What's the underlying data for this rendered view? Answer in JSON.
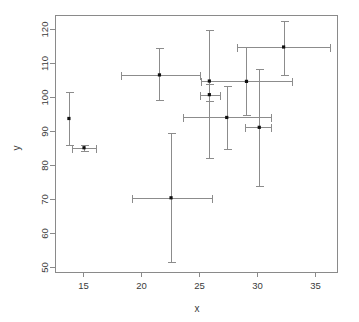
{
  "chart_data": {
    "type": "scatter",
    "title": "",
    "xlabel": "x",
    "ylabel": "y",
    "grid": false,
    "legend": "none",
    "xlim": [
      12.6,
      36.9
    ],
    "ylim": [
      48.5,
      124.0
    ],
    "xticks": [
      15,
      20,
      25,
      30,
      35
    ],
    "yticks": [
      50,
      60,
      70,
      80,
      90,
      100,
      110,
      120
    ],
    "xtick_labels": [
      "15",
      "20",
      "25",
      "30",
      "35"
    ],
    "ytick_labels": [
      "50",
      "60",
      "70",
      "80",
      "90",
      "100",
      "110",
      "120"
    ],
    "error_bars": "both",
    "points": [
      {
        "x": 13.8,
        "y": 93.6,
        "xerr_low": 13.8,
        "xerr_high": 13.8,
        "yerr_low": 85.7,
        "yerr_high": 101.4
      },
      {
        "x": 15.1,
        "y": 85.0,
        "xerr_low": 14.1,
        "xerr_high": 16.1,
        "yerr_low": 84.1,
        "yerr_high": 85.9
      },
      {
        "x": 21.6,
        "y": 106.4,
        "xerr_low": 18.3,
        "xerr_high": 25.1,
        "yerr_low": 99.0,
        "yerr_high": 114.3
      },
      {
        "x": 22.6,
        "y": 70.3,
        "xerr_low": 19.2,
        "xerr_high": 26.1,
        "yerr_low": 51.4,
        "yerr_high": 89.3
      },
      {
        "x": 25.9,
        "y": 100.6,
        "xerr_low": 25.1,
        "xerr_high": 26.8,
        "yerr_low": 98.6,
        "yerr_high": 103.6
      },
      {
        "x": 25.9,
        "y": 104.6,
        "xerr_low": 25.9,
        "xerr_high": 25.9,
        "yerr_low": 82.0,
        "yerr_high": 119.5
      },
      {
        "x": 27.4,
        "y": 93.9,
        "xerr_low": 23.6,
        "xerr_high": 31.2,
        "yerr_low": 84.5,
        "yerr_high": 103.0
      },
      {
        "x": 29.1,
        "y": 104.5,
        "xerr_low": 25.2,
        "xerr_high": 33.0,
        "yerr_low": 94.5,
        "yerr_high": 114.7
      },
      {
        "x": 30.2,
        "y": 91.0,
        "xerr_low": 29.0,
        "xerr_high": 31.2,
        "yerr_low": 73.9,
        "yerr_high": 108.2
      },
      {
        "x": 32.3,
        "y": 114.6,
        "xerr_low": 28.3,
        "xerr_high": 36.3,
        "yerr_low": 106.4,
        "yerr_high": 122.1
      }
    ]
  },
  "colors": {
    "point": "#101010",
    "errorbar": "#8c8c8c",
    "frame": "#8a8a8a",
    "text": "#3a3a3a",
    "background": "#ffffff"
  }
}
